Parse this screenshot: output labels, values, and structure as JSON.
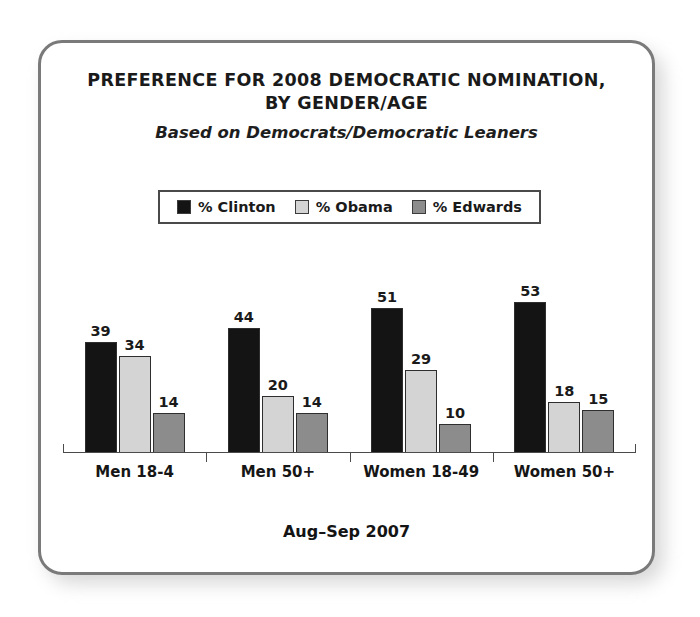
{
  "card": {
    "title_lines": [
      "PREFERENCE FOR 2008 DEMOCRATIC NOMINATION,",
      "BY GENDER/AGE"
    ],
    "subtitle": "Based on Democrats/Democratic Leaners",
    "footer_note": "Aug–Sep 2007"
  },
  "legend": {
    "items": [
      {
        "label": "% Clinton",
        "color": "#141414",
        "swatch_icon": "filled-square-icon"
      },
      {
        "label": "% Obama",
        "color": "#d4d4d4",
        "swatch_icon": "filled-square-icon"
      },
      {
        "label": "% Edwards",
        "color": "#8c8c8c",
        "swatch_icon": "filled-square-icon"
      }
    ]
  },
  "chart_data": {
    "type": "bar",
    "title": "PREFERENCE FOR 2008 DEMOCRATIC NOMINATION, BY GENDER/AGE",
    "subtitle": "Based on Democrats/Democratic Leaners",
    "note": "Aug–Sep 2007",
    "xlabel": "",
    "ylabel": "",
    "ylim": [
      0,
      60
    ],
    "grid": false,
    "legend_position": "top-center",
    "value_labels": true,
    "categories": [
      "Men 18-4",
      "Men 50+",
      "Women 18-49",
      "Women 50+"
    ],
    "series": [
      {
        "name": "% Clinton",
        "color": "#141414",
        "values": [
          39,
          44,
          51,
          53
        ]
      },
      {
        "name": "% Obama",
        "color": "#d4d4d4",
        "values": [
          34,
          20,
          29,
          18
        ]
      },
      {
        "name": "% Edwards",
        "color": "#8c8c8c",
        "values": [
          14,
          14,
          10,
          15
        ]
      }
    ]
  }
}
